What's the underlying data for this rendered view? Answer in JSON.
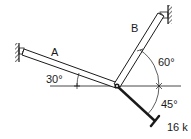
{
  "diagram": {
    "type": "statics-truss-joint",
    "members": [
      {
        "label": "A",
        "angle_label": "30°"
      },
      {
        "label": "B",
        "angle_label": "60°"
      }
    ],
    "load": {
      "value_label": "16 k",
      "angle_label": "45°"
    }
  },
  "colors": {
    "ink": "#1a1a1a",
    "background": "#ffffff"
  }
}
